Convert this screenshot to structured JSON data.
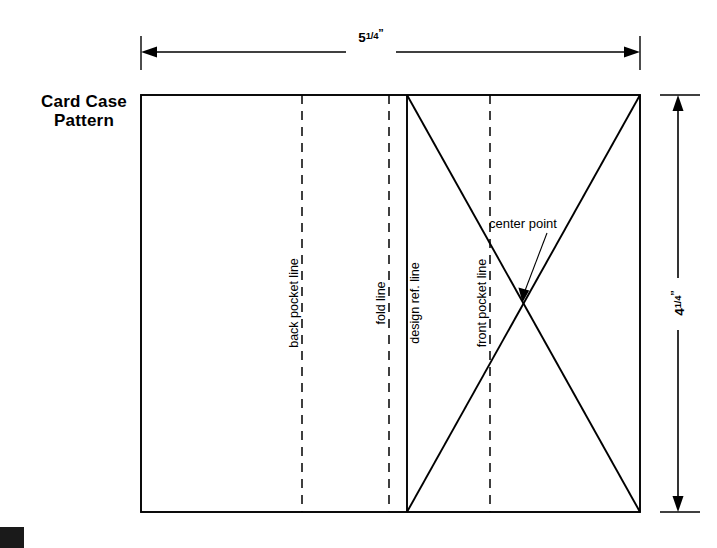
{
  "page": {
    "background_color": "#ffffff",
    "line_color": "#000000"
  },
  "title": {
    "line1": "Card Case",
    "line2": "Pattern"
  },
  "dimensions": {
    "width": {
      "whole": "5",
      "numerator": "1",
      "denominator": "4",
      "unit": "”",
      "full_text": "5 1/4\"",
      "orientation": "horizontal",
      "position": "top"
    },
    "height": {
      "whole": "4",
      "numerator": "1",
      "denominator": "4",
      "unit": "”",
      "full_text": "4 1/4\"",
      "orientation": "vertical",
      "position": "right"
    }
  },
  "labels": {
    "back_pocket_line": "back pocket line",
    "fold_line": "fold line",
    "design_ref_line": "design ref. line",
    "front_pocket_line": "front pocket line",
    "center_point": "center point"
  },
  "geometry": {
    "rect": {
      "x": 141,
      "y": 95,
      "width": 499,
      "height": 417
    },
    "vertical_lines": [
      {
        "name": "back-pocket-line",
        "x": 302,
        "style": "dashed"
      },
      {
        "name": "fold-line",
        "x": 389,
        "style": "dashed"
      },
      {
        "name": "design-ref-line",
        "x": 407,
        "style": "solid"
      },
      {
        "name": "front-pocket-line",
        "x": 490,
        "style": "dashed"
      }
    ],
    "cross_region": {
      "left": 407,
      "right": 640,
      "top": 95,
      "bottom": 512
    },
    "center_point": {
      "x": 523,
      "y": 303
    }
  }
}
